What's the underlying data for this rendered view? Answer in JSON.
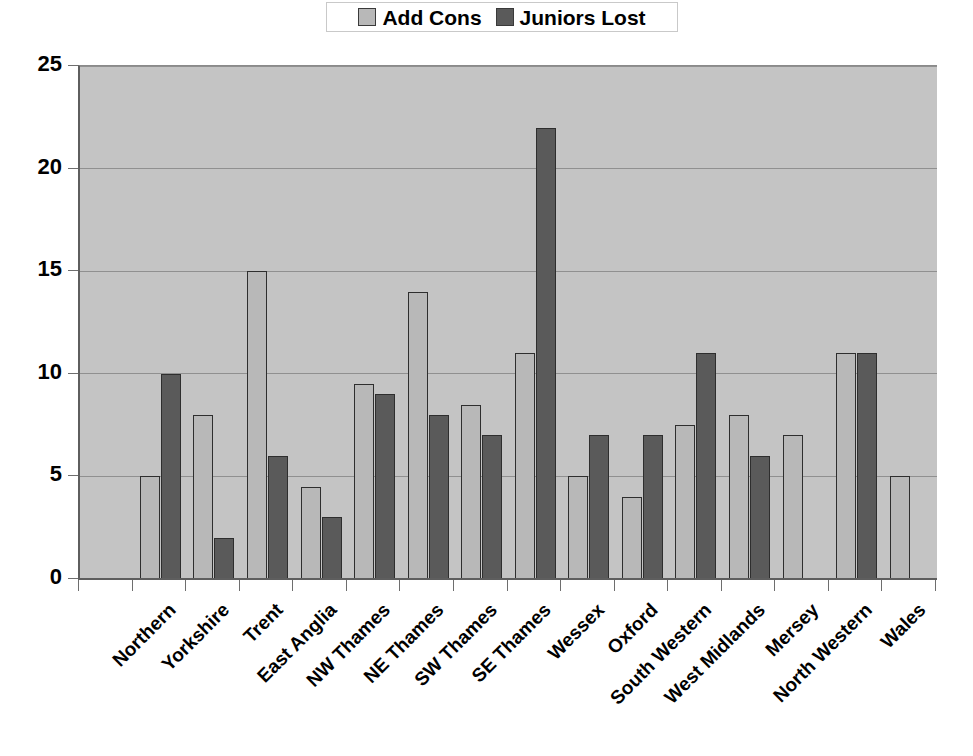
{
  "legend": {
    "position": "top-center",
    "entries": [
      {
        "label": "Add Cons",
        "swatch": "light-grey-square-icon",
        "color": "#b8b8b8"
      },
      {
        "label": "Juniors Lost",
        "swatch": "dark-grey-square-icon",
        "color": "#5a5a5a"
      }
    ]
  },
  "axes": {
    "y_ticks": [
      "25",
      "20",
      "15",
      "10",
      "5",
      "0"
    ]
  },
  "colors": {
    "series_add_cons": "#b8b8b8",
    "series_juniors_lost": "#5a5a5a",
    "plot_background": "#c4c4c4",
    "gridline": "#909090",
    "axis": "#5e5e5e",
    "text": "#000000"
  },
  "chart_data": {
    "type": "bar",
    "title": "",
    "subtitle": "",
    "xlabel": "",
    "ylabel": "",
    "ylim": [
      0,
      25
    ],
    "ytick_interval": 5,
    "grid": true,
    "legend_position": "top-center",
    "categories": [
      "Northern",
      "Yorkshire",
      "Trent",
      "East Anglia",
      "NW Thames",
      "NE Thames",
      "SW Thames",
      "SE Thames",
      "Wessex",
      "Oxford",
      "South Western",
      "West Midlands",
      "Mersey",
      "North Western",
      "Wales"
    ],
    "series": [
      {
        "name": "Add Cons",
        "color": "#b8b8b8",
        "values": [
          5,
          8,
          15,
          4.5,
          9.5,
          14,
          8.5,
          11,
          5,
          4,
          7.5,
          8,
          7,
          11,
          5
        ]
      },
      {
        "name": "Juniors Lost",
        "color": "#5a5a5a",
        "values": [
          10,
          2,
          6,
          3,
          9,
          8,
          7,
          22,
          7,
          7,
          11,
          6,
          0,
          11,
          0
        ]
      }
    ]
  }
}
